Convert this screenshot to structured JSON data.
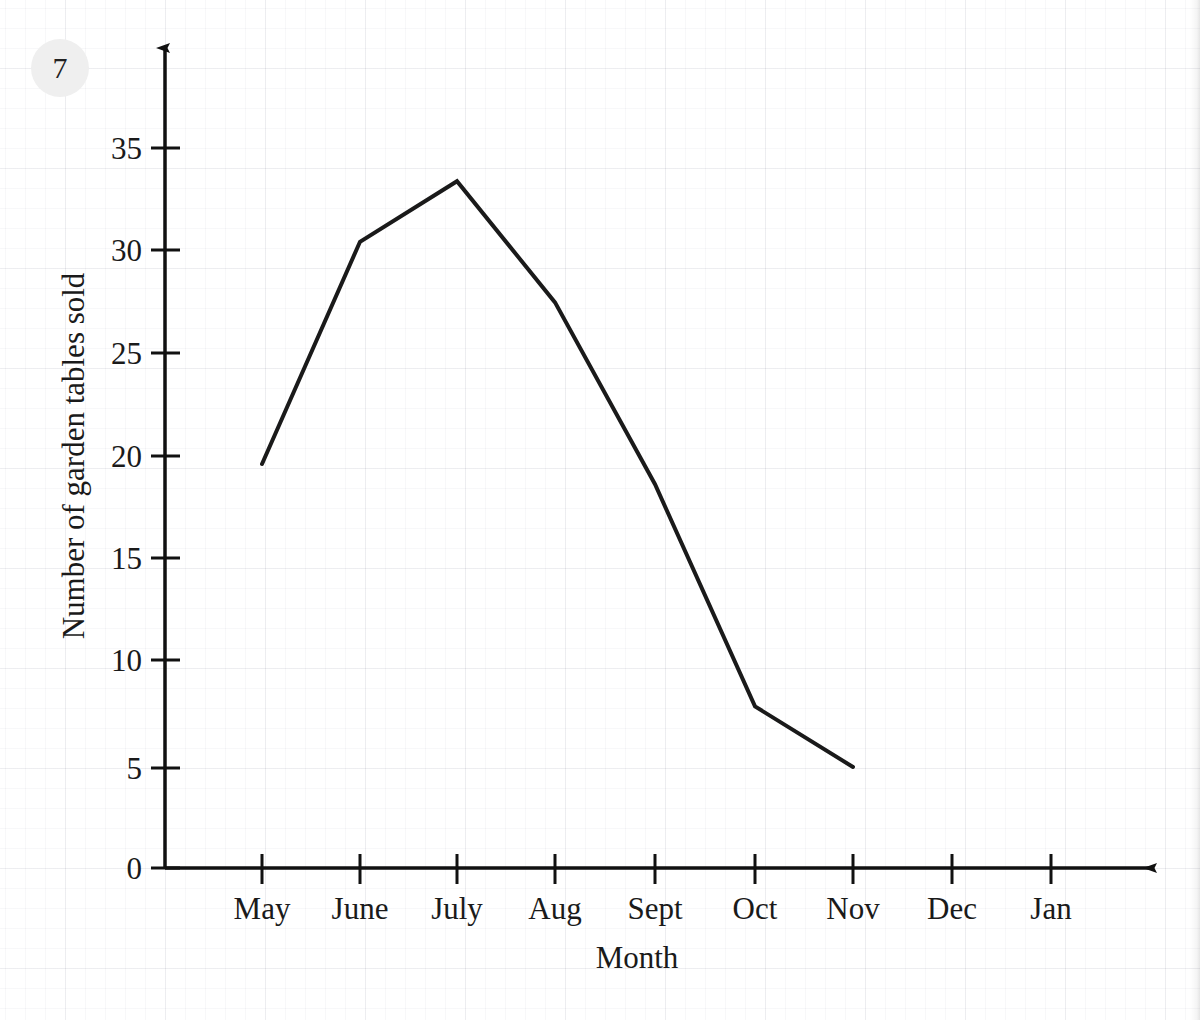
{
  "question": {
    "number": "7"
  },
  "chart_data": {
    "type": "line",
    "title": "",
    "xlabel": "Month",
    "ylabel": "Number of garden tables sold",
    "categories": [
      "May",
      "June",
      "July",
      "Aug",
      "Sept",
      "Oct",
      "Nov",
      "Dec",
      "Jan"
    ],
    "values": [
      20,
      31,
      34,
      28,
      19,
      8,
      5,
      null,
      null
    ],
    "series": [
      {
        "name": "Number of garden tables sold",
        "points": [
          {
            "x": "May",
            "y": 20
          },
          {
            "x": "June",
            "y": 31
          },
          {
            "x": "July",
            "y": 34
          },
          {
            "x": "Aug",
            "y": 28
          },
          {
            "x": "Sept",
            "y": 19
          },
          {
            "x": "Oct",
            "y": 8
          },
          {
            "x": "Nov",
            "y": 5
          }
        ]
      }
    ],
    "ylim": [
      0,
      39
    ],
    "yticks": [
      0,
      5,
      10,
      15,
      20,
      25,
      30,
      35
    ],
    "ytick_labels": [
      "0",
      "5",
      "10",
      "15",
      "20",
      "25",
      "30",
      "35"
    ],
    "xtick_labels": [
      "May",
      "June",
      "July",
      "Aug",
      "Sept",
      "Oct",
      "Nov",
      "Dec",
      "Jan"
    ],
    "grid": true,
    "legend": "none",
    "line_color": "#1a1a1a",
    "axis_color": "#111111",
    "grid_color": "#e8eaf0",
    "background_color": "#ffffff"
  },
  "axis_labels": {
    "y_tick_0": "0",
    "y_tick_5": "5",
    "y_tick_10": "10",
    "y_tick_15": "15",
    "y_tick_20": "20",
    "y_tick_25": "25",
    "y_tick_30": "30",
    "y_tick_35": "35",
    "x_tick_may": "May",
    "x_tick_june": "June",
    "x_tick_july": "July",
    "x_tick_aug": "Aug",
    "x_tick_sept": "Sept",
    "x_tick_oct": "Oct",
    "x_tick_nov": "Nov",
    "x_tick_dec": "Dec",
    "x_tick_jan": "Jan",
    "x_axis_title": "Month",
    "y_axis_title": "Number of garden tables sold"
  }
}
